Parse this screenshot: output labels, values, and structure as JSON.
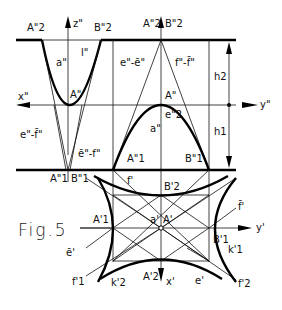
{
  "figure": {
    "caption": "Fig.5",
    "views": {
      "elevation": {
        "axes": {
          "z": "z\"",
          "x": "x\"",
          "y": "y\""
        },
        "labels": {
          "A2": "A\"2",
          "B2": "B\"2",
          "a": "a\"",
          "l": "l\"",
          "A": "A\"",
          "ef_left": "e\"-f̄\"",
          "ef_mid": "ē\"-f\"",
          "ee": "e\"-ē\"",
          "ff": "f\"-f̄\"",
          "A2_right": "A\"2",
          "B2_right": "B\"2",
          "A_right": "A\"",
          "a_right": "a\"",
          "e2": "e\"2",
          "A1": "A\"1",
          "B1": "B\"1",
          "A1_left": "A\"1",
          "B1_left": "B\"1"
        },
        "dimensions": {
          "h2": "h2",
          "h1": "h1"
        }
      },
      "plan": {
        "axes": {
          "y": "y'",
          "x": "x'"
        },
        "labels": {
          "f": "f'",
          "B2": "B'2",
          "A1": "A'1",
          "a": "a'",
          "A": "A'",
          "f_right": "f̄'",
          "B1": "B'1",
          "k1": "k'1",
          "e_bar": "ē'",
          "f1": "f'1",
          "k2": "k'2",
          "A2": "A'2",
          "e": "e'",
          "f2": "f'2"
        }
      }
    }
  }
}
